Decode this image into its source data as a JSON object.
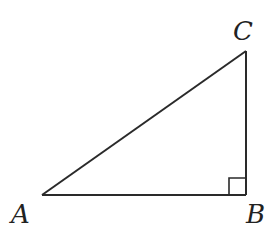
{
  "diagram": {
    "type": "right-triangle",
    "stroke_color": "#2a2a2a",
    "background": "#ffffff",
    "vertices": [
      {
        "id": "A",
        "label": "A",
        "x": 42,
        "y": 195
      },
      {
        "id": "B",
        "label": "B",
        "x": 246,
        "y": 195
      },
      {
        "id": "C",
        "label": "C",
        "x": 246,
        "y": 51
      }
    ],
    "labels": {
      "A": "A",
      "B": "B",
      "C": "C"
    },
    "right_angle_at": "B",
    "right_angle_marker_size": 17
  }
}
